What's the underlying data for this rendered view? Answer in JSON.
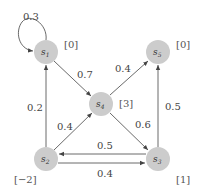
{
  "diagram": {
    "type": "markov-reward-graph",
    "node_color": "#cccccc",
    "edge_color": "#444444",
    "nodes": [
      {
        "id": "s1",
        "base": "s",
        "sub": "1",
        "reward": "[0]"
      },
      {
        "id": "s2",
        "base": "s",
        "sub": "2",
        "reward": "[−2]"
      },
      {
        "id": "s3",
        "base": "s",
        "sub": "3",
        "reward": "[1]"
      },
      {
        "id": "s4",
        "base": "s",
        "sub": "4",
        "reward": "[3]"
      },
      {
        "id": "s5",
        "base": "s",
        "sub": "5",
        "reward": "[0]"
      }
    ],
    "edges": [
      {
        "from": "s1",
        "to": "s1",
        "label": "0.3"
      },
      {
        "from": "s1",
        "to": "s4",
        "label": "0.7"
      },
      {
        "from": "s2",
        "to": "s1",
        "label": "0.2"
      },
      {
        "from": "s2",
        "to": "s4",
        "label": "0.4"
      },
      {
        "from": "s2",
        "to": "s3",
        "label": "0.4"
      },
      {
        "from": "s3",
        "to": "s2",
        "label": "0.5"
      },
      {
        "from": "s3",
        "to": "s5",
        "label": "0.5"
      },
      {
        "from": "s4",
        "to": "s5",
        "label": "0.4"
      },
      {
        "from": "s4",
        "to": "s3",
        "label": "0.6"
      }
    ]
  }
}
